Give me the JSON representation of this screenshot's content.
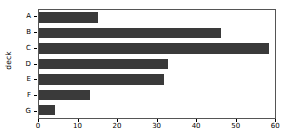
{
  "chart_data": {
    "type": "bar",
    "orientation": "horizontal",
    "title": "",
    "xlabel": "",
    "ylabel": "deck",
    "categories": [
      "A",
      "B",
      "C",
      "D",
      "E",
      "F",
      "G"
    ],
    "values": [
      15,
      46.5,
      58.7,
      33,
      32,
      13,
      4
    ],
    "xlim": [
      0,
      60.2
    ],
    "xticks": [
      0,
      10,
      20,
      30,
      40,
      50,
      60
    ],
    "xticklabels": [
      "0",
      "10",
      "20",
      "30",
      "40",
      "50",
      "60"
    ],
    "yticklabels": [
      "A",
      "B",
      "C",
      "D",
      "E",
      "F",
      "G"
    ],
    "grid": false,
    "legend": null,
    "bar_color": "#3a3a3a",
    "axes_color": "#555555",
    "background": "#ffffff"
  }
}
